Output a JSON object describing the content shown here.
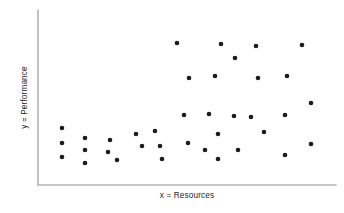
{
  "figure": {
    "width": 344,
    "height": 213,
    "background_color": "#ffffff"
  },
  "axes": {
    "line_color": "#b4b4b4",
    "marker_color": "#1c1c1c",
    "origin_x": 38,
    "origin_y": 185,
    "x_axis_end": 336,
    "y_axis_top": 10
  },
  "labels": {
    "x_axis": "x = Resources",
    "y_axis": "y = Performance"
  },
  "chart_data": {
    "type": "scatter",
    "title": "",
    "xlabel": "x = Resources",
    "ylabel": "y = Performance",
    "xlim": [
      0,
      100
    ],
    "ylim": [
      0,
      100
    ],
    "grid": false,
    "legend": null,
    "tick_labels": {
      "x": [],
      "y": []
    },
    "marker": {
      "shape": "circle",
      "color": "#1c1c1c",
      "size_px": 4.6
    },
    "n_points": 37,
    "points_px": [
      [
        62,
        128
      ],
      [
        62,
        143
      ],
      [
        62,
        157
      ],
      [
        85,
        138
      ],
      [
        85,
        150
      ],
      [
        85,
        163
      ],
      [
        110,
        140
      ],
      [
        108,
        152
      ],
      [
        117,
        160
      ],
      [
        136,
        134
      ],
      [
        142,
        146
      ],
      [
        155,
        131
      ],
      [
        160,
        146
      ],
      [
        162,
        159
      ],
      [
        177,
        43
      ],
      [
        184,
        115
      ],
      [
        188,
        143
      ],
      [
        189,
        78
      ],
      [
        209,
        114
      ],
      [
        215,
        76
      ],
      [
        218,
        134
      ],
      [
        218,
        159
      ],
      [
        221,
        44
      ],
      [
        235,
        58
      ],
      [
        238,
        150
      ],
      [
        251,
        117
      ],
      [
        256,
        46
      ],
      [
        258,
        78
      ],
      [
        264,
        132
      ],
      [
        285,
        115
      ],
      [
        285,
        155
      ],
      [
        287,
        76
      ],
      [
        302,
        45
      ],
      [
        311,
        103
      ],
      [
        311,
        144
      ],
      [
        234,
        116
      ],
      [
        205,
        150
      ]
    ],
    "points_data": [
      [
        8.1,
        42.0
      ],
      [
        8.1,
        24.0
      ],
      [
        8.1,
        8.0
      ],
      [
        15.8,
        36.0
      ],
      [
        15.8,
        21.5
      ],
      [
        15.8,
        6.0
      ],
      [
        24.2,
        33.5
      ],
      [
        23.5,
        19.0
      ],
      [
        26.5,
        10.5
      ],
      [
        32.9,
        41.0
      ],
      [
        34.9,
        26.5
      ],
      [
        39.3,
        44.5
      ],
      [
        40.9,
        26.5
      ],
      [
        41.6,
        11.0
      ],
      [
        46.6,
        94.5
      ],
      [
        49.0,
        10.0
      ],
      [
        50.3,
        40.0
      ],
      [
        50.7,
        52.5
      ],
      [
        57.4,
        41.5
      ],
      [
        58.4,
        54.0
      ],
      [
        59.4,
        35.0
      ],
      [
        60.4,
        80.0
      ],
      [
        61.4,
        94.5
      ],
      [
        66.1,
        76.5
      ],
      [
        67.1,
        37.5
      ],
      [
        71.5,
        39.0
      ],
      [
        73.2,
        93.5
      ],
      [
        73.8,
        73.0
      ],
      [
        75.8,
        43.0
      ],
      [
        82.9,
        40.0
      ],
      [
        82.9,
        17.5
      ],
      [
        83.6,
        65.5
      ],
      [
        88.6,
        94.0
      ],
      [
        91.6,
        62.5
      ],
      [
        91.6,
        23.5
      ],
      [
        65.8,
        39.5
      ],
      [
        56.0,
        20.0
      ]
    ]
  }
}
